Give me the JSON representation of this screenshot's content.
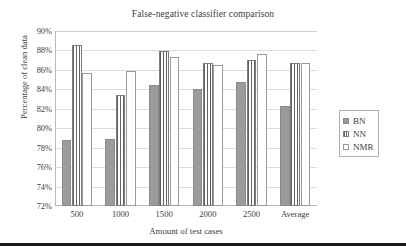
{
  "chart_data": {
    "type": "bar",
    "title": "False-negative classifier comparison",
    "xlabel": "Amount of test cases",
    "ylabel": "Percentage of clean data",
    "categories": [
      "500",
      "1000",
      "1500",
      "2000",
      "2500",
      "Average"
    ],
    "series": [
      {
        "name": "BN",
        "values": [
          78.8,
          78.9,
          84.4,
          84.0,
          84.8,
          82.3
        ]
      },
      {
        "name": "NN",
        "values": [
          88.6,
          83.4,
          87.9,
          86.7,
          87.0,
          86.7
        ]
      },
      {
        "name": "NMR",
        "values": [
          85.7,
          85.9,
          87.3,
          86.5,
          87.6,
          86.7
        ]
      }
    ],
    "ylim": [
      72,
      90
    ],
    "ytick_step": 2,
    "ytick_labels": [
      "72%",
      "74%",
      "76%",
      "78%",
      "80%",
      "82%",
      "84%",
      "86%",
      "88%",
      "90%"
    ],
    "grid": true,
    "legend_position": "right",
    "colors": {
      "bn": "#9b9b9b",
      "nn": "#ffffff",
      "nmr": "#ffffff",
      "bn_border": "#8a8a8a",
      "nn_stripe": "#606060",
      "nmr_border": "#9a9a9a",
      "axis": "#b9b9b9",
      "gridline": "#dcdcdc",
      "text": "#3d3d3d"
    }
  },
  "legend": {
    "items": [
      {
        "label": "BN"
      },
      {
        "label": "NN"
      },
      {
        "label": "NMR"
      }
    ]
  }
}
